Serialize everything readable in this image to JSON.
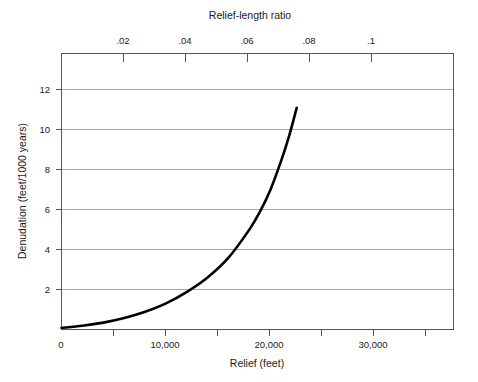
{
  "chart_data": {
    "type": "line",
    "title": "",
    "xlabel": "Relief (feet)",
    "ylabel": "Denudation (feet/1000 years)",
    "secondary_xlabel": "Relief-length ratio",
    "xlim": [
      0,
      37500
    ],
    "ylim": [
      0,
      13.2
    ],
    "secondary_xlim": [
      0,
      0.1209677
    ],
    "grid": true,
    "legend": null,
    "xticks": [
      0,
      5000,
      10000,
      15000,
      20000,
      25000,
      30000,
      35000
    ],
    "xticklabels": [
      "0",
      "",
      "10,000",
      "",
      "20,000",
      "",
      "30,000",
      ""
    ],
    "yticks": [
      0,
      2,
      4,
      6,
      8,
      10,
      12
    ],
    "yticklabels": [
      "0",
      "2",
      "4",
      "6",
      "8",
      "10",
      "12"
    ],
    "secondary_xticks": [
      0.02,
      0.04,
      0.06,
      0.08,
      0.1
    ],
    "secondary_xticklabels": [
      ".02",
      ".04",
      ".06",
      ".08",
      ".1"
    ],
    "series": [
      {
        "name": "denudation-rate",
        "x": [
          0,
          2000,
          4000,
          6000,
          8000,
          10000,
          12000,
          14000,
          16000,
          18000,
          19000,
          20000,
          21000,
          21800,
          22500
        ],
        "values": [
          0.08,
          0.18,
          0.33,
          0.55,
          0.85,
          1.25,
          1.8,
          2.5,
          3.45,
          4.8,
          5.65,
          6.7,
          8.05,
          9.3,
          10.6
        ]
      }
    ]
  },
  "labels": {
    "top_axis_title": "Relief-length ratio",
    "bottom_axis_title": "Relief (feet)",
    "left_axis_title": "Denudation (feet/1000 years)"
  }
}
